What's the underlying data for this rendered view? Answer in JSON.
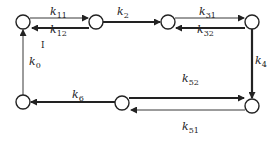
{
  "diagram": {
    "type": "reaction-network",
    "nodes": [
      {
        "id": "n1",
        "x": 23,
        "y": 22
      },
      {
        "id": "n2",
        "x": 96,
        "y": 22
      },
      {
        "id": "n3",
        "x": 168,
        "y": 22
      },
      {
        "id": "n4",
        "x": 252,
        "y": 22
      },
      {
        "id": "n5",
        "x": 252,
        "y": 106
      },
      {
        "id": "n6",
        "x": 122,
        "y": 103
      },
      {
        "id": "n7",
        "x": 23,
        "y": 102
      }
    ],
    "edges": [
      {
        "from": "n1",
        "to": "n2",
        "label": "k",
        "sub": "11",
        "weight": "thin"
      },
      {
        "from": "n2",
        "to": "n1",
        "label": "k",
        "sub": "12",
        "weight": "thick"
      },
      {
        "from": "n2",
        "to": "n3",
        "label": "k",
        "sub": "2",
        "weight": "thick"
      },
      {
        "from": "n3",
        "to": "n4",
        "label": "k",
        "sub": "31",
        "weight": "thin"
      },
      {
        "from": "n4",
        "to": "n3",
        "label": "k",
        "sub": "32",
        "weight": "thick"
      },
      {
        "from": "n4",
        "to": "n5",
        "label": "k",
        "sub": "4",
        "weight": "thick"
      },
      {
        "from": "n6",
        "to": "n5",
        "label": "k",
        "sub": "52",
        "weight": "thick"
      },
      {
        "from": "n5",
        "to": "n6",
        "label": "k",
        "sub": "51",
        "weight": "thin"
      },
      {
        "from": "n6",
        "to": "n7",
        "label": "k",
        "sub": "6",
        "weight": "thick"
      },
      {
        "from": "n7",
        "to": "n1",
        "label": "k",
        "sub": "0",
        "weight": "thin"
      }
    ],
    "annotations": [
      {
        "text": "I",
        "x": 41,
        "y": 48
      }
    ]
  }
}
